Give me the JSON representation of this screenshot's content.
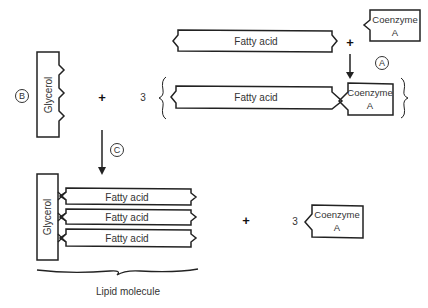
{
  "diagram": {
    "labels": {
      "fatty_acid": "Fatty acid",
      "glycerol": "Glycerol",
      "coenzyme_a_line1": "Coenzyme",
      "coenzyme_a_line2": "A",
      "lipid_molecule": "Lipid molecule",
      "plus": "+",
      "three": "3"
    },
    "steps": {
      "a": "A",
      "b": "B",
      "c": "C"
    },
    "colors": {
      "stroke": "#222222",
      "text": "#333333",
      "background": "#ffffff"
    }
  }
}
